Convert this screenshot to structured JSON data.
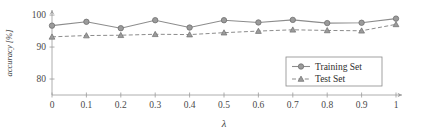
{
  "chart_data": {
    "type": "line",
    "title": "",
    "xlabel": "λ",
    "ylabel": "accuracy [%]",
    "x": [
      0,
      0.1,
      0.2,
      0.3,
      0.4,
      0.5,
      0.6,
      0.7,
      0.8,
      0.9,
      1
    ],
    "xtick_labels": [
      "0",
      "0.1",
      "0.2",
      "0.3",
      "0.4",
      "0.5",
      "0.6",
      "0.7",
      "0.8",
      "0.9",
      "1"
    ],
    "ytick_labels": [
      "80",
      "90",
      "100"
    ],
    "yticks": [
      80,
      90,
      100
    ],
    "xlim": [
      0,
      1
    ],
    "ylim": [
      75,
      100.5
    ],
    "grid": false,
    "legend_position": "bottom-right",
    "series": [
      {
        "name": "Training Set",
        "marker": "circle",
        "linestyle": "solid",
        "color": "#9b9b9b",
        "values": [
          96.7,
          97.9,
          95.9,
          98.4,
          96.1,
          98.4,
          97.7,
          98.5,
          97.5,
          97.6,
          98.9
        ]
      },
      {
        "name": "Test Set",
        "marker": "triangle",
        "linestyle": "dashed",
        "color": "#9b9b9b",
        "values": [
          93.2,
          93.6,
          93.7,
          94.0,
          93.9,
          94.5,
          95.0,
          95.4,
          95.2,
          95.1,
          97.1
        ]
      }
    ]
  },
  "legend": {
    "entries": [
      {
        "label": "Training Set"
      },
      {
        "label": "Test Set"
      }
    ]
  },
  "axes": {
    "x_title": "λ",
    "y_title": "accuracy [%]"
  }
}
